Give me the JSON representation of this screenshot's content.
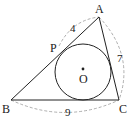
{
  "figure": {
    "type": "geometry-triangle-incircle",
    "vertices": {
      "A": {
        "label": "A",
        "x": 99,
        "y": 17
      },
      "B": {
        "label": "B",
        "x": 11,
        "y": 100
      },
      "C": {
        "label": "C",
        "x": 119,
        "y": 100
      }
    },
    "tangent_point": {
      "label": "P",
      "x": 59,
      "y": 46
    },
    "incircle": {
      "center_label": "O",
      "cx": 83,
      "cy": 72,
      "r": 28
    },
    "lengths": {
      "AP": "4",
      "AC": "7",
      "BC": "9"
    },
    "colors": {
      "line": "#222222",
      "dash": "#999999"
    }
  }
}
